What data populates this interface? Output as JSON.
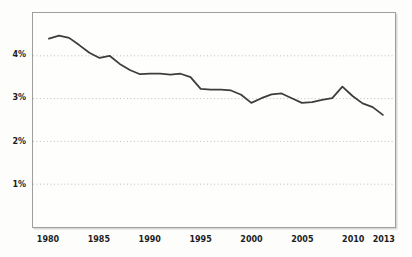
{
  "figure": {
    "background_color": "#fdfdfc",
    "frame_border_color": "#9e9e9e",
    "grid_color": "#bcbcbc",
    "line_color": "#3d3d3d",
    "tick_label_color": "#1c1c1c"
  },
  "chart_data": {
    "type": "line",
    "title": "",
    "xlabel": "",
    "ylabel": "",
    "x": [
      1980,
      1981,
      1982,
      1983,
      1984,
      1985,
      1986,
      1987,
      1988,
      1989,
      1990,
      1991,
      1992,
      1993,
      1994,
      1995,
      1996,
      1997,
      1998,
      1999,
      2000,
      2001,
      2002,
      2003,
      2004,
      2005,
      2006,
      2007,
      2008,
      2009,
      2010,
      2011,
      2012,
      2013
    ],
    "values": [
      4.4,
      4.47,
      4.42,
      4.25,
      4.07,
      3.95,
      4.0,
      3.81,
      3.67,
      3.57,
      3.58,
      3.58,
      3.56,
      3.58,
      3.5,
      3.23,
      3.21,
      3.21,
      3.19,
      3.09,
      2.9,
      3.01,
      3.1,
      3.12,
      3.01,
      2.9,
      2.92,
      2.97,
      3.01,
      3.28,
      3.06,
      2.89,
      2.8,
      2.62
    ],
    "series_name": "rate-percent",
    "xlim": [
      1978.43,
      2014.2
    ],
    "ylim": [
      0,
      5
    ],
    "y_ticks": [
      {
        "value": 4,
        "label": "4%"
      },
      {
        "value": 3,
        "label": "3%"
      },
      {
        "value": 2,
        "label": "2%"
      },
      {
        "value": 1,
        "label": "1%"
      }
    ],
    "x_ticks": [
      {
        "value": 1980,
        "label": "1980"
      },
      {
        "value": 1985,
        "label": "1985"
      },
      {
        "value": 1990,
        "label": "1990"
      },
      {
        "value": 1995,
        "label": "1995"
      },
      {
        "value": 2000,
        "label": "2000"
      },
      {
        "value": 2005,
        "label": "2005"
      },
      {
        "value": 2010,
        "label": "2010"
      },
      {
        "value": 2013,
        "label": "2013"
      }
    ],
    "grid": "horizontal-dotted",
    "legend_position": "none"
  }
}
